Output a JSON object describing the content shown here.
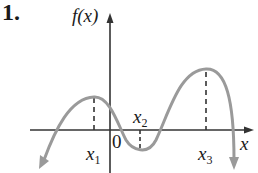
{
  "problem": {
    "number": "1."
  },
  "graph": {
    "y_axis_label": "f(x)",
    "x_axis_label": "x",
    "origin_label": "0",
    "points": [
      {
        "name": "x",
        "sub": "1",
        "role": "local maximum"
      },
      {
        "name": "x",
        "sub": "2",
        "role": "local minimum"
      },
      {
        "name": "x",
        "sub": "3",
        "role": "local maximum"
      }
    ],
    "colors": {
      "curve": "#9a9a9a",
      "axes": "#333333",
      "text": "#1a1a1a"
    }
  }
}
